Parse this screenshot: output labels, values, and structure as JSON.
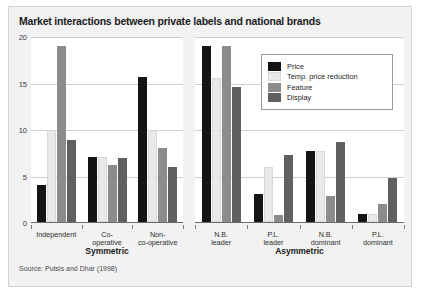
{
  "figure": {
    "title": "Market interactions between private labels and national brands",
    "source": "Source: Putsis and Dhar (1998)"
  },
  "chart_data": {
    "type": "bar",
    "title": "Market interactions between private labels and national brands",
    "xlabel": "",
    "ylabel": "",
    "ylim": [
      0,
      20
    ],
    "yticks": [
      0,
      5,
      10,
      15,
      20
    ],
    "grid": true,
    "legend_position": "top-right inside right panel",
    "series_names": [
      "Price",
      "Temp. price reduction",
      "Feature",
      "Display"
    ],
    "series_colors": [
      "#141414",
      "#e9e9e9",
      "#8c8c8c",
      "#606060"
    ],
    "panels": [
      {
        "name": "Symmetric",
        "categories": [
          "Independent",
          "Co-\noperative",
          "Non-\nco-operative"
        ],
        "series": [
          {
            "name": "Price",
            "values": [
              4.0,
              7.0,
              15.7
            ]
          },
          {
            "name": "Temp. price reduction",
            "values": [
              10.0,
              7.0,
              10.0
            ]
          },
          {
            "name": "Feature",
            "values": [
              19.0,
              6.2,
              8.0
            ]
          },
          {
            "name": "Display",
            "values": [
              8.9,
              6.9,
              5.9
            ]
          }
        ]
      },
      {
        "name": "Asymmetric",
        "categories": [
          "N.B.\nleader",
          "P.L.\nleader",
          "N.B.\ndominant",
          "P.L.\ndominant"
        ],
        "series": [
          {
            "name": "Price",
            "values": [
              19.0,
              3.0,
              7.7,
              0.9
            ]
          },
          {
            "name": "Temp. price reduction",
            "values": [
              15.6,
              6.0,
              7.7,
              0.9
            ]
          },
          {
            "name": "Feature",
            "values": [
              19.0,
              0.8,
              2.8,
              1.9
            ]
          },
          {
            "name": "Display",
            "values": [
              14.6,
              7.2,
              8.7,
              4.8
            ]
          }
        ]
      }
    ]
  },
  "legend": {
    "items": [
      {
        "label": "Price",
        "color": "#141414"
      },
      {
        "label": "Temp. price reduction",
        "color": "#e9e9e9"
      },
      {
        "label": "Feature",
        "color": "#8c8c8c"
      },
      {
        "label": "Display",
        "color": "#606060"
      }
    ]
  },
  "yticks": [
    {
      "label": "20"
    },
    {
      "label": "15"
    },
    {
      "label": "10"
    },
    {
      "label": "5"
    },
    {
      "label": "0"
    }
  ]
}
